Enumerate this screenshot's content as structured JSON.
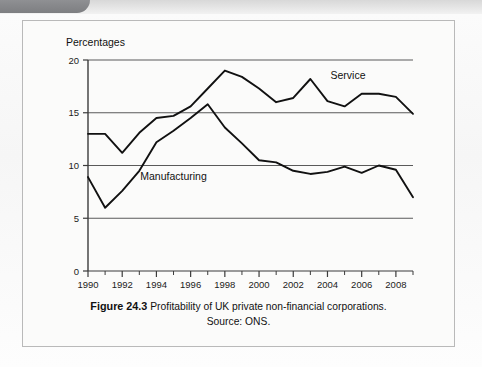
{
  "figure": {
    "label": "Figure 24.3",
    "title": "Profitability of UK private non-financial corporations.",
    "source": "Source: ONS."
  },
  "colors": {
    "line": "#111111",
    "gridline": "#5a5a5a",
    "axis": "#3b3b3b",
    "frame_border": "#b9b9b9",
    "figure_background": "#fbfbfa",
    "page_tab": "#7d7e81"
  },
  "chart_data": {
    "type": "line",
    "title": "Profitability of UK private non-financial corporations.",
    "xlabel": "",
    "ylabel": "Percentages",
    "ylim": [
      0,
      20
    ],
    "xlim": [
      1990,
      2009
    ],
    "yticks": [
      "0",
      "5",
      "10",
      "15",
      "20"
    ],
    "ytick_values": [
      0,
      5,
      10,
      15,
      20
    ],
    "xticks": [
      "1990",
      "1992",
      "1994",
      "1996",
      "1998",
      "2000",
      "2002",
      "2004",
      "2006",
      "2008"
    ],
    "xtick_values": [
      1990,
      1992,
      1994,
      1996,
      1998,
      2000,
      2002,
      2004,
      2006,
      2008
    ],
    "minor_xtick_values": [
      1991,
      1993,
      1995,
      1997,
      1999,
      2001,
      2003,
      2005,
      2007,
      2009
    ],
    "grid": "horizontal",
    "legend": "inline-annotation",
    "x": [
      1990,
      1991,
      1992,
      1993,
      1994,
      1995,
      1996,
      1997,
      1998,
      1999,
      2000,
      2001,
      2002,
      2003,
      2004,
      2005,
      2006,
      2007,
      2008,
      2009
    ],
    "series": [
      {
        "name": "Service",
        "annotation_x": 2005.2,
        "annotation_y": 18.2,
        "values": [
          13.0,
          13.0,
          11.2,
          13.1,
          14.5,
          14.7,
          15.6,
          17.3,
          19.0,
          18.4,
          17.3,
          16.0,
          16.4,
          18.2,
          16.1,
          15.6,
          16.8,
          16.8,
          16.5,
          14.9
        ]
      },
      {
        "name": "Manufacturing",
        "annotation_x": 1995.0,
        "annotation_y": 8.6,
        "values": [
          8.9,
          6.0,
          7.6,
          9.5,
          12.2,
          13.3,
          14.5,
          15.8,
          13.6,
          12.1,
          10.5,
          10.3,
          9.5,
          9.2,
          9.4,
          9.9,
          9.3,
          10.0,
          9.6,
          7.0
        ]
      }
    ]
  }
}
